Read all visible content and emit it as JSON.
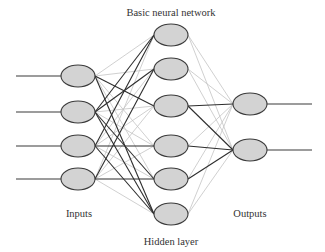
{
  "title": "Basic neural network",
  "labels": {
    "inputs": "Inputs",
    "hidden": "Hidden layer",
    "outputs": "Outputs"
  },
  "layers": {
    "inputs": 4,
    "hidden": 6,
    "outputs": 2
  },
  "colors": {
    "node_fill": "#d3d3d3",
    "node_stroke": "#3a3a3a",
    "edge_strong": "#2e2e2e",
    "edge_weak": "#c4c4c4",
    "line": "#3a3a3a"
  },
  "strong_edges": {
    "input_to_hidden": [
      [
        0,
        2
      ],
      [
        1,
        0
      ],
      [
        1,
        1
      ],
      [
        1,
        4
      ],
      [
        1,
        5
      ],
      [
        2,
        0
      ],
      [
        2,
        3
      ],
      [
        2,
        5
      ],
      [
        3,
        1
      ],
      [
        3,
        4
      ],
      [
        0,
        5
      ]
    ],
    "hidden_to_output": [
      [
        2,
        0
      ],
      [
        2,
        1
      ],
      [
        3,
        1
      ],
      [
        4,
        1
      ]
    ]
  }
}
